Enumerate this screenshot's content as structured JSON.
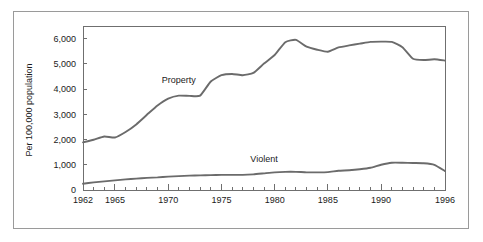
{
  "chart_data": {
    "type": "line",
    "title": "",
    "xlabel": "",
    "ylabel": "Per 100,000 population",
    "xlim": [
      1962,
      1996
    ],
    "ylim": [
      0,
      6500
    ],
    "grid": false,
    "legend_position": "inline-labels",
    "y_ticks": [
      0,
      1000,
      2000,
      3000,
      4000,
      5000,
      6000
    ],
    "y_tick_labels": [
      "0",
      "1,000",
      "2,000",
      "3,000",
      "4,000",
      "5,000",
      "6,000"
    ],
    "x_ticks": [
      1962,
      1963,
      1964,
      1965,
      1966,
      1967,
      1968,
      1969,
      1970,
      1971,
      1972,
      1973,
      1974,
      1975,
      1976,
      1977,
      1978,
      1979,
      1980,
      1981,
      1982,
      1983,
      1984,
      1985,
      1986,
      1987,
      1988,
      1989,
      1990,
      1991,
      1992,
      1993,
      1994,
      1995,
      1996
    ],
    "x_major_ticks": [
      1962,
      1965,
      1970,
      1975,
      1980,
      1985,
      1990,
      1996
    ],
    "x_tick_labels": [
      "1962",
      "1965",
      "1970",
      "1975",
      "1980",
      "1985",
      "1990",
      "1996"
    ],
    "x": [
      1962,
      1963,
      1964,
      1965,
      1966,
      1967,
      1968,
      1969,
      1970,
      1971,
      1972,
      1973,
      1974,
      1975,
      1976,
      1977,
      1978,
      1979,
      1980,
      1981,
      1982,
      1983,
      1984,
      1985,
      1986,
      1987,
      1988,
      1989,
      1990,
      1991,
      1992,
      1993,
      1994,
      1995,
      1996
    ],
    "series": [
      {
        "name": "Property",
        "color": "#6b6b6b",
        "label_x": 1971,
        "label_y": 4250,
        "values": [
          1890,
          1990,
          2120,
          2080,
          2300,
          2600,
          2980,
          3350,
          3620,
          3740,
          3730,
          3740,
          4300,
          4550,
          4600,
          4550,
          4640,
          5010,
          5350,
          5860,
          5950,
          5680,
          5560,
          5480,
          5650,
          5730,
          5800,
          5870,
          5880,
          5870,
          5660,
          5200,
          5150,
          5180,
          5130
        ]
      },
      {
        "name": "Violent",
        "color": "#6b6b6b",
        "label_x": 1979,
        "label_y": 1100,
        "values": [
          250,
          300,
          340,
          380,
          420,
          450,
          480,
          500,
          530,
          550,
          570,
          580,
          590,
          600,
          600,
          600,
          620,
          660,
          700,
          720,
          720,
          700,
          700,
          710,
          760,
          780,
          820,
          880,
          1000,
          1080,
          1080,
          1070,
          1060,
          1000,
          750
        ]
      }
    ]
  }
}
